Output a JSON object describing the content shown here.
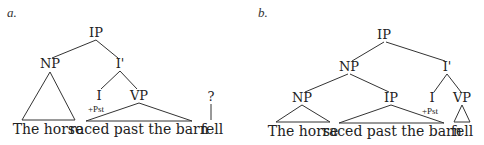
{
  "tree_a": {
    "tag": "a.",
    "nodes": {
      "root": "IP",
      "subject": "NP",
      "ibar": "I'",
      "infl": "I",
      "infl_feature": "+Pst",
      "vp": "VP",
      "unknown": "?"
    },
    "words": {
      "subject": "The horse",
      "predicate": "raced past the barn",
      "extra": "fell"
    }
  },
  "tree_b": {
    "tag": "b.",
    "nodes": {
      "root": "IP",
      "subject": "NP",
      "ibar": "I'",
      "inner_np": "NP",
      "rel_ip": "IP",
      "infl": "I",
      "infl_feature": "+Pst",
      "vp": "VP"
    },
    "words": {
      "subject": "The horse",
      "relative": "raced past the barn",
      "verb": "fell"
    }
  }
}
